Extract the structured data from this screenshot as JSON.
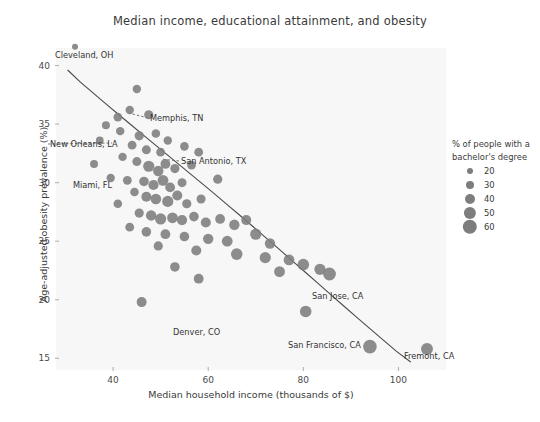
{
  "chart_data": {
    "type": "scatter",
    "title": "Median income, educational attainment, and obesity",
    "xlabel": "Median household income (thousands of $)",
    "ylabel": "Age-adjusted obesity prevalence (%)",
    "xlim": [
      28,
      110
    ],
    "ylim": [
      14,
      41.5
    ],
    "xticks": [
      40,
      60,
      80,
      100
    ],
    "yticks": [
      15,
      20,
      25,
      30,
      35,
      40
    ],
    "grid": false,
    "marker_color": "#7d7d7d",
    "trendline": {
      "x0": 30.5,
      "y0": 39.6,
      "x1": 102.5,
      "y1": 14.7,
      "color": "#4a4a4a"
    },
    "size_legend": {
      "title_line1": "% of people with a",
      "title_line2": "bachelor's degree",
      "entries": [
        {
          "label": "20",
          "value": 20,
          "radius_px": 3.0
        },
        {
          "label": "30",
          "value": 30,
          "radius_px": 4.0
        },
        {
          "label": "40",
          "value": 40,
          "radius_px": 5.0
        },
        {
          "label": "50",
          "value": 50,
          "radius_px": 6.1
        },
        {
          "label": "60",
          "value": 60,
          "radius_px": 7.2
        }
      ]
    },
    "series_name": "US cities",
    "points": [
      {
        "x": 32.0,
        "y": 41.6,
        "bachelor": 17,
        "r": 3.0,
        "label": "Cleveland, OH"
      },
      {
        "x": 45.0,
        "y": 38.0,
        "bachelor": 26,
        "r": 4.2
      },
      {
        "x": 41.0,
        "y": 35.6,
        "bachelor": 28,
        "r": 4.4
      },
      {
        "x": 43.5,
        "y": 36.2,
        "bachelor": 27,
        "r": 4.2
      },
      {
        "x": 47.5,
        "y": 35.8,
        "bachelor": 30,
        "r": 4.6,
        "label": "Memphis, TN"
      },
      {
        "x": 38.5,
        "y": 34.9,
        "bachelor": 24,
        "r": 4.0
      },
      {
        "x": 41.5,
        "y": 34.4,
        "bachelor": 25,
        "r": 4.2
      },
      {
        "x": 37.2,
        "y": 33.6,
        "bachelor": 22,
        "r": 3.9,
        "label": "New Orleans, LA"
      },
      {
        "x": 45.5,
        "y": 34.0,
        "bachelor": 28,
        "r": 4.6
      },
      {
        "x": 49.0,
        "y": 34.2,
        "bachelor": 31,
        "r": 4.3
      },
      {
        "x": 51.5,
        "y": 33.6,
        "bachelor": 32,
        "r": 4.2
      },
      {
        "x": 44.0,
        "y": 33.2,
        "bachelor": 27,
        "r": 4.4
      },
      {
        "x": 47.0,
        "y": 32.8,
        "bachelor": 29,
        "r": 4.5
      },
      {
        "x": 50.0,
        "y": 32.6,
        "bachelor": 31,
        "r": 4.4
      },
      {
        "x": 55.0,
        "y": 33.1,
        "bachelor": 34,
        "r": 4.3
      },
      {
        "x": 58.0,
        "y": 32.6,
        "bachelor": 36,
        "r": 4.4,
        "label": "San Antonio, TX"
      },
      {
        "x": 36.0,
        "y": 31.6,
        "bachelor": 21,
        "r": 4.0,
        "label": "Miami, FL"
      },
      {
        "x": 42.0,
        "y": 32.2,
        "bachelor": 25,
        "r": 4.2
      },
      {
        "x": 45.0,
        "y": 31.8,
        "bachelor": 28,
        "r": 4.5
      },
      {
        "x": 47.5,
        "y": 31.4,
        "bachelor": 30,
        "r": 5.6
      },
      {
        "x": 49.5,
        "y": 31.0,
        "bachelor": 31,
        "r": 5.2
      },
      {
        "x": 51.0,
        "y": 31.6,
        "bachelor": 32,
        "r": 4.9
      },
      {
        "x": 53.0,
        "y": 31.2,
        "bachelor": 33,
        "r": 4.6
      },
      {
        "x": 56.5,
        "y": 31.5,
        "bachelor": 35,
        "r": 4.4
      },
      {
        "x": 39.5,
        "y": 30.4,
        "bachelor": 23,
        "r": 4.2
      },
      {
        "x": 43.0,
        "y": 30.2,
        "bachelor": 26,
        "r": 4.4
      },
      {
        "x": 46.5,
        "y": 30.1,
        "bachelor": 29,
        "r": 4.8
      },
      {
        "x": 48.5,
        "y": 29.8,
        "bachelor": 30,
        "r": 5.1
      },
      {
        "x": 50.5,
        "y": 30.2,
        "bachelor": 32,
        "r": 5.4
      },
      {
        "x": 52.0,
        "y": 29.6,
        "bachelor": 33,
        "r": 4.9
      },
      {
        "x": 54.5,
        "y": 30.0,
        "bachelor": 34,
        "r": 4.5
      },
      {
        "x": 62.0,
        "y": 30.3,
        "bachelor": 39,
        "r": 4.6
      },
      {
        "x": 44.5,
        "y": 29.2,
        "bachelor": 27,
        "r": 4.3
      },
      {
        "x": 47.0,
        "y": 28.8,
        "bachelor": 29,
        "r": 5.0
      },
      {
        "x": 49.0,
        "y": 28.6,
        "bachelor": 31,
        "r": 5.3
      },
      {
        "x": 51.5,
        "y": 28.4,
        "bachelor": 32,
        "r": 5.6
      },
      {
        "x": 53.5,
        "y": 28.9,
        "bachelor": 34,
        "r": 5.0
      },
      {
        "x": 41.0,
        "y": 28.2,
        "bachelor": 25,
        "r": 4.3
      },
      {
        "x": 55.5,
        "y": 28.2,
        "bachelor": 35,
        "r": 4.6
      },
      {
        "x": 58.5,
        "y": 28.6,
        "bachelor": 37,
        "r": 4.5
      },
      {
        "x": 45.5,
        "y": 27.4,
        "bachelor": 28,
        "r": 4.6
      },
      {
        "x": 48.0,
        "y": 27.2,
        "bachelor": 30,
        "r": 5.2
      },
      {
        "x": 50.0,
        "y": 26.9,
        "bachelor": 32,
        "r": 5.6
      },
      {
        "x": 52.5,
        "y": 27.0,
        "bachelor": 33,
        "r": 5.4
      },
      {
        "x": 54.5,
        "y": 26.8,
        "bachelor": 34,
        "r": 5.1
      },
      {
        "x": 57.0,
        "y": 27.1,
        "bachelor": 36,
        "r": 4.8
      },
      {
        "x": 59.5,
        "y": 26.6,
        "bachelor": 38,
        "r": 5.0
      },
      {
        "x": 62.5,
        "y": 26.9,
        "bachelor": 40,
        "r": 4.9
      },
      {
        "x": 65.5,
        "y": 26.4,
        "bachelor": 42,
        "r": 5.2
      },
      {
        "x": 68.0,
        "y": 26.8,
        "bachelor": 43,
        "r": 5.0
      },
      {
        "x": 43.5,
        "y": 26.2,
        "bachelor": 26,
        "r": 4.4
      },
      {
        "x": 47.0,
        "y": 25.8,
        "bachelor": 30,
        "r": 4.8
      },
      {
        "x": 51.0,
        "y": 25.6,
        "bachelor": 32,
        "r": 4.9
      },
      {
        "x": 55.0,
        "y": 25.4,
        "bachelor": 35,
        "r": 4.8
      },
      {
        "x": 60.0,
        "y": 25.2,
        "bachelor": 38,
        "r": 5.2
      },
      {
        "x": 64.0,
        "y": 25.0,
        "bachelor": 41,
        "r": 5.4
      },
      {
        "x": 70.0,
        "y": 25.6,
        "bachelor": 45,
        "r": 5.6
      },
      {
        "x": 73.0,
        "y": 24.8,
        "bachelor": 46,
        "r": 5.2
      },
      {
        "x": 49.5,
        "y": 24.6,
        "bachelor": 31,
        "r": 4.6
      },
      {
        "x": 57.5,
        "y": 24.2,
        "bachelor": 36,
        "r": 5.0
      },
      {
        "x": 66.0,
        "y": 23.9,
        "bachelor": 43,
        "r": 5.8
      },
      {
        "x": 72.0,
        "y": 23.6,
        "bachelor": 46,
        "r": 5.6
      },
      {
        "x": 77.0,
        "y": 23.4,
        "bachelor": 49,
        "r": 5.4
      },
      {
        "x": 80.0,
        "y": 23.0,
        "bachelor": 51,
        "r": 5.8
      },
      {
        "x": 83.5,
        "y": 22.6,
        "bachelor": 53,
        "r": 5.6
      },
      {
        "x": 53.0,
        "y": 22.8,
        "bachelor": 33,
        "r": 4.8
      },
      {
        "x": 75.0,
        "y": 22.4,
        "bachelor": 48,
        "r": 5.4
      },
      {
        "x": 85.5,
        "y": 22.2,
        "bachelor": 56,
        "r": 6.4,
        "label": "San Jose, CA"
      },
      {
        "x": 58.0,
        "y": 21.8,
        "bachelor": 37,
        "r": 4.9
      },
      {
        "x": 46.0,
        "y": 19.8,
        "bachelor": 29,
        "r": 5.0,
        "label": "Denver, CO"
      },
      {
        "x": 80.5,
        "y": 19.0,
        "bachelor": 58,
        "r": 5.8,
        "label": "San Francisco, CA"
      },
      {
        "x": 94.0,
        "y": 16.0,
        "bachelor": 60,
        "r": 6.8
      },
      {
        "x": 106.0,
        "y": 15.8,
        "bachelor": 59,
        "r": 6.0,
        "label": "Fremont, CA"
      }
    ],
    "annotations": [
      {
        "text": "Cleveland, OH",
        "lx": 55,
        "ly": 50,
        "px": 68,
        "py": 42,
        "leader": false
      },
      {
        "text": "Memphis, TN",
        "lx": 150,
        "ly": 113,
        "px": 129,
        "py": 113,
        "leader": true
      },
      {
        "text": "New Orleans, LA",
        "lx": 50,
        "ly": 139,
        "px": 112,
        "py": 143,
        "leader": true
      },
      {
        "text": "San Antonio, TX",
        "lx": 181,
        "ly": 156,
        "px": 161,
        "py": 159,
        "leader": true
      },
      {
        "text": "Miami, FL",
        "lx": 73,
        "ly": 180,
        "px": 95,
        "py": 170,
        "leader": false
      },
      {
        "text": "San Jose, CA",
        "lx": 312,
        "ly": 291,
        "px": 330,
        "py": 302,
        "leader": false
      },
      {
        "text": "Denver, CO",
        "lx": 173,
        "ly": 327,
        "px": 191,
        "py": 313,
        "leader": false
      },
      {
        "text": "San Francisco, CA",
        "lx": 288,
        "ly": 340,
        "px": 315,
        "py": 323,
        "leader": false
      },
      {
        "text": "Fremont, CA",
        "lx": 404,
        "ly": 351,
        "px": 421,
        "py": 363,
        "leader": false
      }
    ]
  }
}
